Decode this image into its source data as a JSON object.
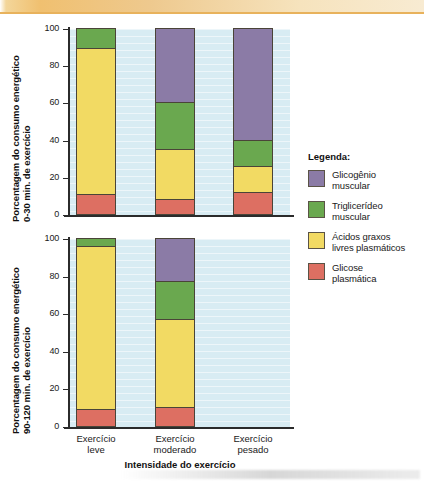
{
  "figure": {
    "xaxis_title": "Intensidade do exercício",
    "categories": [
      "Exercício leve",
      "Exercício moderado",
      "Exercício pesado"
    ],
    "category_lines": [
      [
        "Exercício",
        "leve"
      ],
      [
        "Exercício",
        "moderado"
      ],
      [
        "Exercício",
        "pesado"
      ]
    ],
    "tick_labels": [
      "100",
      "80",
      "60",
      "40",
      "20",
      "0"
    ],
    "tick_values": [
      100,
      80,
      60,
      40,
      20,
      0
    ]
  },
  "legend": {
    "title": "Legenda:",
    "items": [
      {
        "label_lines": [
          "Glicogênio",
          "muscular"
        ],
        "name": "Glicogênio muscular",
        "color": "#8b7ba6"
      },
      {
        "label_lines": [
          "Triglicerídeo",
          "muscular"
        ],
        "name": "Triglicerídeo muscular",
        "color": "#6aa84f"
      },
      {
        "label_lines": [
          "Ácidos graxos",
          "livres plasmáticos"
        ],
        "name": "Ácidos graxos livres plasmáticos",
        "color": "#f2da63"
      },
      {
        "label_lines": [
          "Glicose",
          "plasmática"
        ],
        "name": "Glicose plasmática",
        "color": "#dd6f62"
      }
    ]
  },
  "chart_top": {
    "ylabel_lines": [
      "Porcentagem do consumo energético",
      "0-30 min. de exercício"
    ]
  },
  "chart_bottom": {
    "ylabel_lines": [
      "Porcentagem do consumo energético",
      "90-120 min. de exercício"
    ]
  },
  "chart_data": [
    {
      "type": "bar",
      "stacked": true,
      "title": "",
      "panel": "0-30 min. de exercício",
      "xlabel": "Intensidade do exercício",
      "ylabel": "Porcentagem do consumo energético 0-30 min. de exercício",
      "ylim": [
        0,
        100
      ],
      "yticks": [
        0,
        20,
        40,
        60,
        80,
        100
      ],
      "grid": true,
      "legend_position": "right",
      "categories": [
        "Exercício leve",
        "Exercício moderado",
        "Exercício pesado"
      ],
      "series": [
        {
          "name": "Glicose plasmática",
          "color": "#dd6f62",
          "values": [
            11,
            8,
            12
          ]
        },
        {
          "name": "Ácidos graxos livres plasmáticos",
          "color": "#f2da63",
          "values": [
            78,
            27,
            14
          ]
        },
        {
          "name": "Triglicerídeo muscular",
          "color": "#6aa84f",
          "values": [
            11,
            25,
            14
          ]
        },
        {
          "name": "Glicogênio muscular",
          "color": "#8b7ba6",
          "values": [
            0,
            40,
            60
          ]
        }
      ]
    },
    {
      "type": "bar",
      "stacked": true,
      "title": "",
      "panel": "90-120 min. de exercício",
      "xlabel": "Intensidade do exercício",
      "ylabel": "Porcentagem do consumo energético 90-120 min. de exercício",
      "ylim": [
        0,
        100
      ],
      "yticks": [
        0,
        20,
        40,
        60,
        80,
        100
      ],
      "grid": true,
      "legend_position": "right",
      "categories": [
        "Exercício leve",
        "Exercício moderado",
        "Exercício pesado"
      ],
      "series": [
        {
          "name": "Glicose plasmática",
          "color": "#dd6f62",
          "values": [
            9,
            10,
            0
          ]
        },
        {
          "name": "Ácidos graxos livres plasmáticos",
          "color": "#f2da63",
          "values": [
            87,
            47,
            0
          ]
        },
        {
          "name": "Triglicerídeo muscular",
          "color": "#6aa84f",
          "values": [
            4,
            20,
            0
          ]
        },
        {
          "name": "Glicogênio muscular",
          "color": "#8b7ba6",
          "values": [
            0,
            23,
            0
          ]
        }
      ]
    }
  ]
}
